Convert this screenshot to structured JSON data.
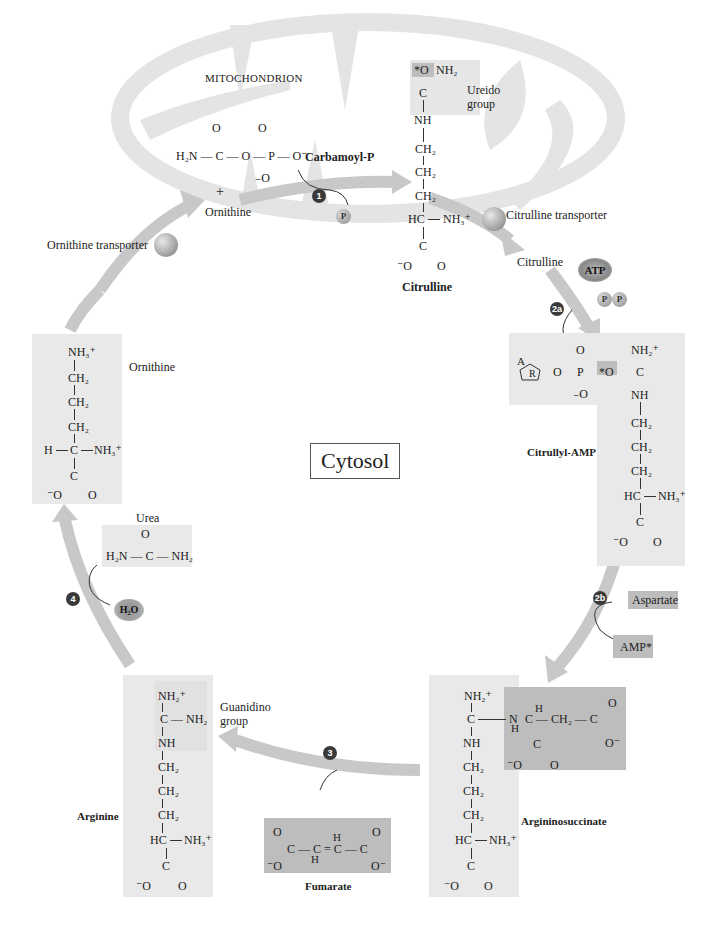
{
  "figure": {
    "compartments": {
      "mitochondrion": "MITOCHONDRION",
      "cytosol": "Cytosol"
    },
    "colors": {
      "mitochondrion_fill": "#e4e4e4",
      "arrow": "#c8c8c8",
      "light_box": "#e9e9e9",
      "dark_box": "#bdbdbd",
      "step_badge": "#3a3a3a"
    },
    "steps": [
      {
        "id": "step-1",
        "label": "1"
      },
      {
        "id": "step-2a",
        "label": "2a"
      },
      {
        "id": "step-2b",
        "label": "2b"
      },
      {
        "id": "step-3",
        "label": "3"
      },
      {
        "id": "step-4",
        "label": "4"
      }
    ],
    "transporters": {
      "ornithine": "Ornithine transporter",
      "citrulline": "Citrulline transporter"
    },
    "carbamoyl_p": {
      "name": "Carbamoyl-P",
      "formula_row": "H₂N — C — O — P — O⁻",
      "o_top_1": "O",
      "o_top_2": "O",
      "o_bottom": "₋O",
      "plus": "+",
      "ornithine_label": "Ornithine"
    },
    "pi_label": "P",
    "citrulline": {
      "name": "Citrulline",
      "ureido_label": "Ureido",
      "ureido_label2": "group",
      "star_o": "*O",
      "nh2": "NH₂",
      "c": "C",
      "nh": "NH",
      "ch2": "CH₂",
      "hc": "HC",
      "nh3": "NH₃⁺",
      "o_minus": "⁻O",
      "o": "O",
      "cytosol_label": "Citrulline"
    },
    "atp": "ATP",
    "ppi": [
      "P",
      "P"
    ],
    "citrullyl_amp": {
      "name": "Citrullyl-AMP",
      "a": "A",
      "r": "R",
      "o": "O",
      "p": "P",
      "o_minus": "₋O",
      "star_o": "*O",
      "nh2plus": "NH₂⁺",
      "c": "C",
      "nh": "NH",
      "ch2": "CH₂",
      "hc": "HC",
      "nh3": "NH₃⁺",
      "coo_minus": "⁻O",
      "coo_o": "O"
    },
    "aspartate": "Aspartate",
    "amp": "AMP*",
    "argininosuccinate": {
      "name": "Argininosuccinate",
      "nh2plus": "NH₂⁺",
      "c": "C",
      "nh": "NH",
      "ch2": "CH₂",
      "hc": "HC",
      "nh3": "NH₃⁺",
      "o_minus": "⁻O",
      "o": "O",
      "n": "N",
      "h": "H",
      "succ_row": "C — CH₂ — C",
      "o_end": "O⁻"
    },
    "fumarate": {
      "name": "Fumarate",
      "row": "C — C = C — C",
      "h": "H",
      "o": "O",
      "o_minus_left": "⁻O",
      "o_minus_right": "O⁻"
    },
    "arginine": {
      "name": "Arginine",
      "guanidino_label": "Guanidino",
      "guanidino_label2": "group",
      "nh2plus": "NH₂⁺",
      "c_nh2": "C — NH₂",
      "nh": "NH",
      "ch2": "CH₂",
      "hc": "HC",
      "nh3": "NH₃⁺",
      "c": "C",
      "o_minus": "⁻O",
      "o": "O"
    },
    "urea": {
      "name": "Urea",
      "o": "O",
      "row": "H₂N — C — NH₂"
    },
    "water": "H₂O",
    "ornithine": {
      "name": "Ornithine",
      "nh3_top": "NH₃⁺",
      "ch2": "CH₂",
      "h": "H",
      "c": "C",
      "nh3": "NH₃⁺",
      "o_minus": "⁻O",
      "o": "O"
    }
  }
}
